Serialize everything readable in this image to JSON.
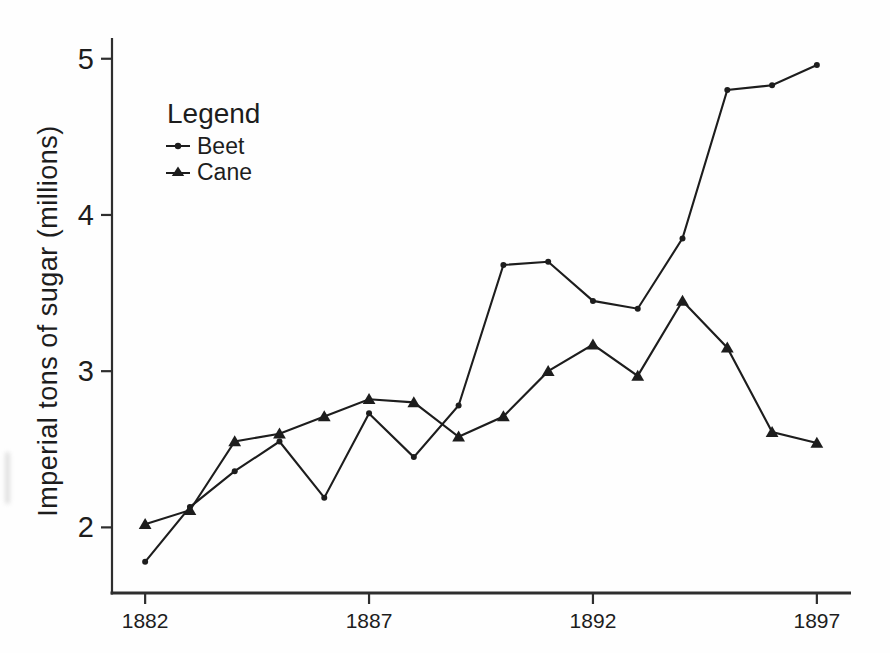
{
  "figure": {
    "ink_color": "#1d1d1d",
    "axis_color": "#2e2e2e",
    "background": "#fefefe"
  },
  "chart_data": {
    "type": "line",
    "title": "",
    "xlabel": "",
    "ylabel": "Imperial tons of sugar (millions)",
    "x": [
      1882,
      1883,
      1884,
      1885,
      1886,
      1887,
      1888,
      1889,
      1890,
      1891,
      1892,
      1893,
      1894,
      1895,
      1896,
      1897
    ],
    "series": [
      {
        "name": "Beet",
        "marker": "dot",
        "values": [
          1.78,
          2.13,
          2.36,
          2.55,
          2.19,
          2.73,
          2.45,
          2.78,
          3.68,
          3.7,
          3.45,
          3.4,
          3.85,
          4.8,
          4.83,
          4.96
        ]
      },
      {
        "name": "Cane",
        "marker": "triangle",
        "values": [
          2.02,
          2.11,
          2.55,
          2.6,
          2.71,
          2.82,
          2.8,
          2.58,
          2.71,
          3.0,
          3.17,
          2.97,
          3.45,
          3.15,
          2.61,
          2.54
        ]
      }
    ],
    "xticks": [
      1882,
      1887,
      1892,
      1897
    ],
    "yticks": [
      2,
      3,
      4,
      5
    ],
    "xlim": [
      1881.26,
      1897.74
    ],
    "ylim": [
      1.58,
      5.12
    ],
    "grid": false,
    "legend": {
      "title": "Legend",
      "position": "upper-left"
    }
  }
}
